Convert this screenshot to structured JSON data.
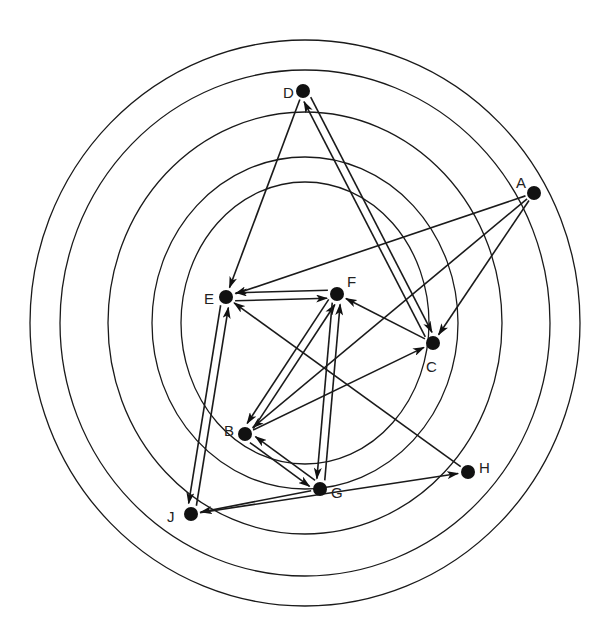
{
  "diagram": {
    "type": "concentric-ring directed graph",
    "center": {
      "x": 305,
      "y": 323
    },
    "rings": [
      {
        "rx": 275,
        "ry": 283
      },
      {
        "rx": 245,
        "ry": 253
      },
      {
        "rx": 197,
        "ry": 211
      },
      {
        "rx": 153,
        "ry": 166
      },
      {
        "rx": 124,
        "ry": 141
      }
    ],
    "colors": {
      "ink": "#111111",
      "background": "#ffffff"
    },
    "nodes": [
      {
        "id": "A",
        "label": "A",
        "x": 534,
        "y": 193,
        "lx": 516,
        "ly": 183
      },
      {
        "id": "B",
        "label": "B",
        "x": 245,
        "y": 434,
        "lx": 224,
        "ly": 431
      },
      {
        "id": "C",
        "label": "C",
        "x": 433,
        "y": 343,
        "lx": 426,
        "ly": 367
      },
      {
        "id": "D",
        "label": "D",
        "x": 303,
        "y": 91,
        "lx": 283,
        "ly": 93
      },
      {
        "id": "E",
        "label": "E",
        "x": 226,
        "y": 297,
        "lx": 204,
        "ly": 299
      },
      {
        "id": "F",
        "label": "F",
        "x": 337,
        "y": 294,
        "lx": 347,
        "ly": 282
      },
      {
        "id": "G",
        "label": "G",
        "x": 320,
        "y": 489,
        "lx": 331,
        "ly": 493
      },
      {
        "id": "H",
        "label": "H",
        "x": 468,
        "y": 472,
        "lx": 479,
        "ly": 468
      },
      {
        "id": "J",
        "label": "J",
        "x": 191,
        "y": 514,
        "lx": 167,
        "ly": 517
      }
    ],
    "edges": [
      {
        "from": "D",
        "to": "E",
        "offset": 0
      },
      {
        "from": "D",
        "to": "C",
        "offset": -4
      },
      {
        "from": "C",
        "to": "D",
        "offset": -4
      },
      {
        "from": "A",
        "to": "E",
        "offset": 0
      },
      {
        "from": "A",
        "to": "B",
        "offset": 0
      },
      {
        "from": "A",
        "to": "C",
        "offset": 0
      },
      {
        "from": "E",
        "to": "F",
        "offset": 4
      },
      {
        "from": "F",
        "to": "E",
        "offset": 4
      },
      {
        "from": "C",
        "to": "F",
        "offset": 0
      },
      {
        "from": "B",
        "to": "C",
        "offset": 0
      },
      {
        "from": "B",
        "to": "F",
        "offset": 4
      },
      {
        "from": "F",
        "to": "B",
        "offset": 4
      },
      {
        "from": "G",
        "to": "F",
        "offset": 4
      },
      {
        "from": "F",
        "to": "G",
        "offset": 4
      },
      {
        "from": "B",
        "to": "G",
        "offset": 4
      },
      {
        "from": "G",
        "to": "B",
        "offset": 4
      },
      {
        "from": "E",
        "to": "J",
        "offset": 4
      },
      {
        "from": "J",
        "to": "E",
        "offset": 4
      },
      {
        "from": "G",
        "to": "J",
        "offset": 0
      },
      {
        "from": "J",
        "to": "H",
        "offset": 0
      },
      {
        "from": "H",
        "to": "E",
        "offset": 0
      }
    ]
  }
}
